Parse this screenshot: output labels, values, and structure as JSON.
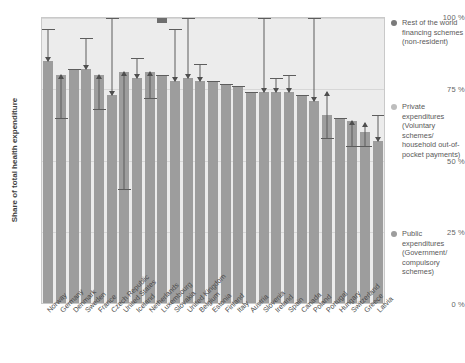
{
  "chart_data": {
    "type": "bar",
    "title": "",
    "xlabel": "",
    "ylabel": "Share of total health expenditure",
    "ylim": [
      0,
      100
    ],
    "grid": true,
    "legend_position": "right",
    "ytick_labels": [
      "100 %",
      "75 %",
      "50 %",
      "25 %",
      "0 %"
    ],
    "ytick_values": [
      100,
      75,
      50,
      25,
      0
    ],
    "categories": [
      "Norway",
      "Germany",
      "Denmark",
      "Sweden",
      "France",
      "Czech Republic",
      "United States",
      "Iceland",
      "Netherlands",
      "Luxembourg",
      "Slovakia",
      "United Kingdom",
      "Belgium",
      "Estonia",
      "Finland",
      "Italy",
      "Austria",
      "Slovenia",
      "Ireland",
      "Spain",
      "Canada",
      "Poland",
      "Portugal",
      "Hungary",
      "Switzerland",
      "Greece",
      "Latvia"
    ],
    "series": [
      {
        "name": "Public expenditures (Government/compulsory schemes)",
        "color": "#9d9d9d",
        "values": [
          85,
          80,
          82,
          82,
          80,
          73,
          81,
          79,
          81,
          80,
          78,
          79,
          78,
          78,
          77,
          76,
          74,
          74,
          74,
          74,
          73,
          71,
          66,
          65,
          64,
          60,
          57
        ]
      },
      {
        "name": "Rest of the world financing schemes (non-resident)",
        "color": "#6e6e6e",
        "values": [
          0,
          0,
          0,
          0,
          0,
          0,
          0,
          0,
          0,
          20,
          0,
          0,
          0,
          0,
          0,
          0,
          0,
          0,
          0,
          0,
          0,
          0,
          0,
          0,
          0,
          0,
          0
        ]
      }
    ],
    "annotations": [
      {
        "country": "Norway",
        "top": 96,
        "bottom": 85,
        "direction": "down"
      },
      {
        "country": "Germany",
        "top": 80,
        "bottom": 65,
        "direction": "up"
      },
      {
        "country": "Denmark",
        "top": 82,
        "bottom": 82,
        "direction": "none"
      },
      {
        "country": "Sweden",
        "top": 93,
        "bottom": 82,
        "direction": "down"
      },
      {
        "country": "France",
        "top": 80,
        "bottom": 68,
        "direction": "up"
      },
      {
        "country": "Czech Republic",
        "top": 100,
        "bottom": 73,
        "direction": "down"
      },
      {
        "country": "United States",
        "top": 81,
        "bottom": 40,
        "direction": "up"
      },
      {
        "country": "Iceland",
        "top": 86,
        "bottom": 79,
        "direction": "down"
      },
      {
        "country": "Netherlands",
        "top": 81,
        "bottom": 72,
        "direction": "up"
      },
      {
        "country": "Luxembourg",
        "top": 80,
        "bottom": 80,
        "direction": "down"
      },
      {
        "country": "Slovakia",
        "top": 96,
        "bottom": 78,
        "direction": "down"
      },
      {
        "country": "United Kingdom",
        "top": 100,
        "bottom": 79,
        "direction": "down"
      },
      {
        "country": "Belgium",
        "top": 84,
        "bottom": 78,
        "direction": "down"
      },
      {
        "country": "Estonia",
        "top": 78,
        "bottom": 78,
        "direction": "up"
      },
      {
        "country": "Finland",
        "top": 77,
        "bottom": 77,
        "direction": "down"
      },
      {
        "country": "Italy",
        "top": 76,
        "bottom": 76,
        "direction": "down"
      },
      {
        "country": "Austria",
        "top": 74,
        "bottom": 74,
        "direction": "down"
      },
      {
        "country": "Slovenia",
        "top": 100,
        "bottom": 74,
        "direction": "down"
      },
      {
        "country": "Ireland",
        "top": 79,
        "bottom": 74,
        "direction": "down"
      },
      {
        "country": "Spain",
        "top": 80,
        "bottom": 74,
        "direction": "down"
      },
      {
        "country": "Canada",
        "top": 73,
        "bottom": 73,
        "direction": "up"
      },
      {
        "country": "Poland",
        "top": 100,
        "bottom": 71,
        "direction": "down"
      },
      {
        "country": "Portugal",
        "top": 74,
        "bottom": 58,
        "direction": "up"
      },
      {
        "country": "Hungary",
        "top": 65,
        "bottom": 65,
        "direction": "down"
      },
      {
        "country": "Switzerland",
        "top": 64,
        "bottom": 55,
        "direction": "up"
      },
      {
        "country": "Greece",
        "top": 63,
        "bottom": 55,
        "direction": "up"
      },
      {
        "country": "Latvia",
        "top": 66,
        "bottom": 57,
        "direction": "down"
      }
    ]
  },
  "legend": {
    "items": [
      {
        "label": "Rest of the world financing schemes (non-resident)",
        "color": "#7a7a7a",
        "top": 0
      },
      {
        "label": "Private expenditures (Voluntary schemes/ household out-of-pocket payments)",
        "color": "#bdbdbd",
        "top": 84
      },
      {
        "label": "Public expenditures (Government/ compulsory schemes)",
        "color": "#9d9d9d",
        "top": 211
      }
    ]
  }
}
